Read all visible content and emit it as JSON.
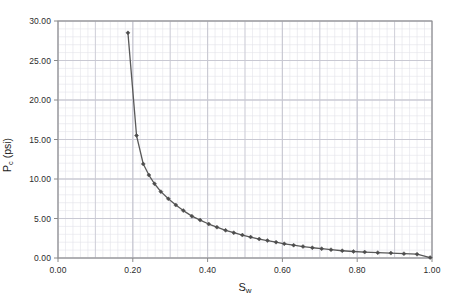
{
  "chart_data": {
    "type": "scatter",
    "title": "",
    "xlabel": "Sw",
    "ylabel": "Pc (psi)",
    "xlabel_base": "S",
    "xlabel_sub": "w",
    "ylabel_base": "P",
    "ylabel_sub": "c",
    "ylabel_units": " (psi)",
    "xlim": [
      0.0,
      1.0
    ],
    "ylim": [
      0.0,
      30.0
    ],
    "x_ticks": [
      "0.00",
      "0.20",
      "0.40",
      "0.60",
      "0.80",
      "1.00"
    ],
    "x_tick_values": [
      0.0,
      0.2,
      0.4,
      0.6,
      0.8,
      1.0
    ],
    "y_ticks": [
      "0.00",
      "5.00",
      "10.00",
      "15.00",
      "20.00",
      "25.00",
      "30.00"
    ],
    "y_tick_values": [
      0.0,
      5.0,
      10.0,
      15.0,
      20.0,
      25.0,
      30.0
    ],
    "x_minor_step": 0.02,
    "y_minor_step": 1.0,
    "grid": true,
    "grid_minor": true,
    "legend": false,
    "marker": "diamond",
    "line_color": "#595959",
    "marker_color": "#4d4d4d",
    "grid_color": "#c8c8d2",
    "grid_minor_color": "#e3e3ea",
    "axis_color": "#8a8a8a",
    "series": [
      {
        "name": "Capillary pressure",
        "x": [
          0.187,
          0.21,
          0.228,
          0.243,
          0.258,
          0.275,
          0.295,
          0.315,
          0.335,
          0.358,
          0.38,
          0.403,
          0.425,
          0.448,
          0.47,
          0.493,
          0.515,
          0.538,
          0.56,
          0.583,
          0.605,
          0.63,
          0.655,
          0.68,
          0.705,
          0.73,
          0.76,
          0.79,
          0.82,
          0.855,
          0.89,
          0.925,
          0.96,
          0.995
        ],
        "y": [
          28.5,
          15.5,
          11.9,
          10.5,
          9.4,
          8.4,
          7.5,
          6.7,
          6.0,
          5.3,
          4.8,
          4.3,
          3.9,
          3.5,
          3.2,
          2.9,
          2.65,
          2.4,
          2.2,
          2.0,
          1.8,
          1.62,
          1.45,
          1.3,
          1.18,
          1.05,
          0.92,
          0.82,
          0.75,
          0.68,
          0.62,
          0.55,
          0.48,
          0.05
        ]
      }
    ]
  },
  "plot_area": {
    "left": 58,
    "top": 21,
    "right": 432,
    "bottom": 258
  }
}
